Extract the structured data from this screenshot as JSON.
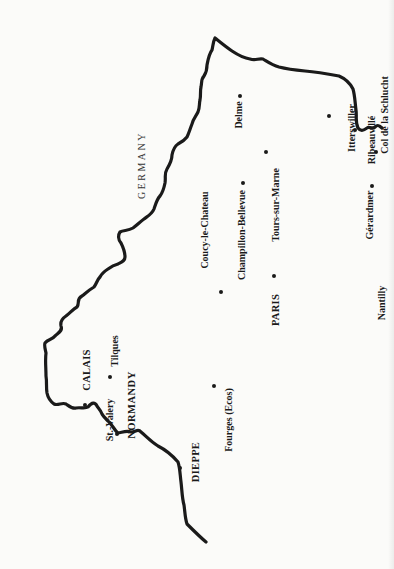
{
  "map": {
    "orientation": "rotated-90-ccw",
    "border_color": "#1a1a1a",
    "background_color": "#fbfbf9",
    "country_label": {
      "text": "GERMANY",
      "x": 142,
      "y": 165
    },
    "places": [
      {
        "id": "delme",
        "name": "Delme",
        "type": "city",
        "label_x": 239,
        "label_y": 115,
        "dot_x": 240,
        "dot_y": 96
      },
      {
        "id": "champillon-bellevue",
        "name": "Champillon-Bellevue",
        "type": "city",
        "label_x": 242,
        "label_y": 235,
        "dot_x": 243,
        "dot_y": 183
      },
      {
        "id": "tours-sur-marne",
        "name": "Tours-sur-Marne",
        "type": "city",
        "label_x": 276,
        "label_y": 205,
        "dot_x": 266,
        "dot_y": 152
      },
      {
        "id": "coucy-le-chateau",
        "name": "Coucy-le-Chateau",
        "type": "city",
        "label_x": 205,
        "label_y": 230,
        "dot_x": 221,
        "dot_y": 292
      },
      {
        "id": "paris",
        "name": "PARIS",
        "type": "major",
        "label_x": 276,
        "label_y": 310,
        "dot_x": 274,
        "dot_y": 276
      },
      {
        "id": "fourges",
        "name": "Fourges (Ecos)",
        "type": "city",
        "label_x": 229,
        "label_y": 420,
        "dot_x": 214,
        "dot_y": 386
      },
      {
        "id": "nantilly",
        "name": "Nantilly",
        "type": "city",
        "label_x": 382,
        "label_y": 303,
        "dot_x": null,
        "dot_y": null
      },
      {
        "id": "gerardmer",
        "name": "Gérardmer",
        "type": "city",
        "label_x": 370,
        "label_y": 215,
        "dot_x": 372,
        "dot_y": 186
      },
      {
        "id": "itterswiller",
        "name": "Itterswiller",
        "type": "city",
        "label_x": 352,
        "label_y": 128,
        "dot_x": 329,
        "dot_y": 116
      },
      {
        "id": "ribeauville",
        "name": "Ribeauvillé",
        "type": "city",
        "label_x": 372,
        "label_y": 140,
        "dot_x": 355,
        "dot_y": 130
      },
      {
        "id": "col-de-la-schlucht",
        "name": "Col de la Schlucht",
        "type": "city",
        "label_x": 385,
        "label_y": 115,
        "dot_x": 376,
        "dot_y": 152
      },
      {
        "id": "calais",
        "name": "CALAIS",
        "type": "major",
        "label_x": 87,
        "label_y": 370,
        "dot_x": 85,
        "dot_y": 405
      },
      {
        "id": "tilques",
        "name": "Tilques",
        "type": "city",
        "label_x": 115,
        "label_y": 351,
        "dot_x": 110,
        "dot_y": 377
      },
      {
        "id": "st-valery",
        "name": "St.-Valery",
        "type": "city",
        "label_x": 110,
        "label_y": 420,
        "dot_x": 117,
        "dot_y": 434
      },
      {
        "id": "normandy",
        "name": "NORMANDY",
        "type": "region",
        "label_x": 132,
        "label_y": 405,
        "dot_x": null,
        "dot_y": null
      },
      {
        "id": "dieppe",
        "name": "DIEPPE",
        "type": "major",
        "label_x": 196,
        "label_y": 462,
        "dot_x": 180,
        "dot_y": 468
      }
    ]
  }
}
